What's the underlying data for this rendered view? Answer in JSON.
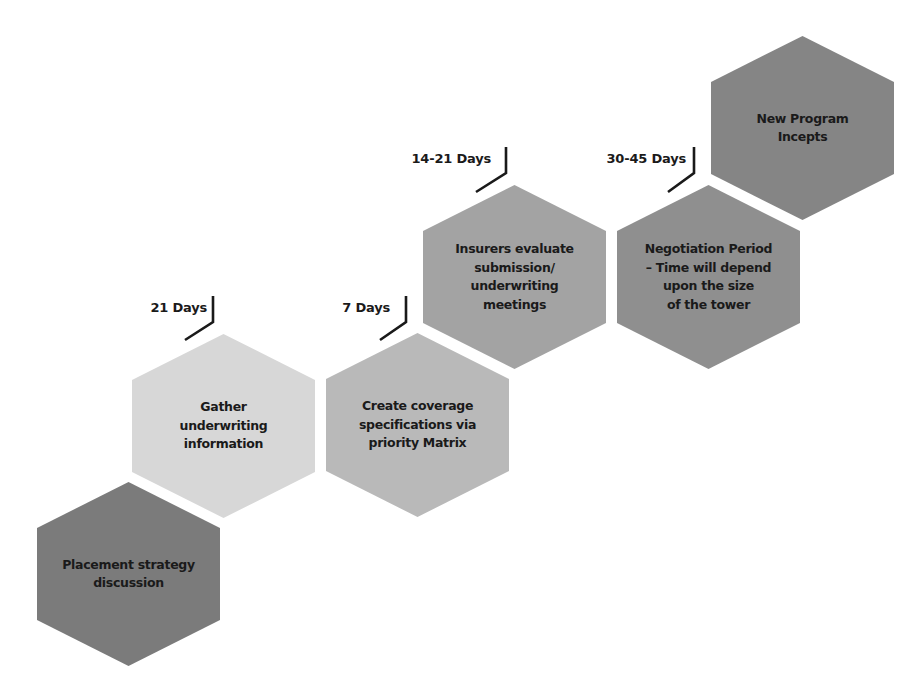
{
  "diagram": {
    "type": "hexagon-timeline",
    "steps": [
      {
        "id": 1,
        "label": "Placement strategy\ndiscussion",
        "color": "#7b7b7b",
        "x": 37,
        "y": 482
      },
      {
        "id": 2,
        "label": "Gather\nunderwriting\ninformation",
        "color": "#d7d7d7",
        "x": 132,
        "y": 334
      },
      {
        "id": 3,
        "label": "Create coverage\nspecifications via\npriority Matrix",
        "color": "#b9b9b9",
        "x": 326,
        "y": 333
      },
      {
        "id": 4,
        "label": "Insurers evaluate\nsubmission/\nunderwriting\nmeetings",
        "color": "#a3a3a3",
        "x": 423,
        "y": 185
      },
      {
        "id": 5,
        "label": "Negotiation Period\n– Time will depend\nupon the size\nof the tower",
        "color": "#8f8f8f",
        "x": 617,
        "y": 185
      },
      {
        "id": 6,
        "label": "New Program\nIncepts",
        "color": "#858585",
        "x": 711,
        "y": 36
      }
    ],
    "durations": [
      {
        "between": "1-2",
        "label": "21 Days",
        "text_right": 207,
        "text_y": 300,
        "line_x": 213,
        "line_top": 296,
        "line_bottom": 322,
        "end_x": 185,
        "end_y": 340
      },
      {
        "between": "2-3",
        "label": "7 Days",
        "text_right": 390,
        "text_y": 300,
        "line_x": 406,
        "line_top": 296,
        "line_bottom": 322,
        "end_x": 380,
        "end_y": 340
      },
      {
        "between": "3-4",
        "label": "14-21 Days",
        "text_right": 491,
        "text_y": 151,
        "line_x": 506,
        "line_top": 147,
        "line_bottom": 173,
        "end_x": 476,
        "end_y": 192
      },
      {
        "between": "4-5",
        "label": "30-45 Days",
        "text_right": 686,
        "text_y": 151,
        "line_x": 694,
        "line_top": 147,
        "line_bottom": 173,
        "end_x": 668,
        "end_y": 192
      }
    ],
    "text_color": "#1a1a1a",
    "background": "#ffffff"
  }
}
